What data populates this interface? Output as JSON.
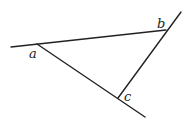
{
  "diagram": {
    "type": "geometry-triangle-lines",
    "background": "#ffffff",
    "line_color": "#222222",
    "lines": [
      {
        "name": "line-ab",
        "x1": 11,
        "y1": 47,
        "x2": 166,
        "y2": 30
      },
      {
        "name": "line-ac",
        "x1": 37,
        "y1": 44,
        "x2": 145,
        "y2": 117
      },
      {
        "name": "line-bc",
        "x1": 181,
        "y1": 12,
        "x2": 118,
        "y2": 98
      }
    ],
    "labels": [
      {
        "name": "label-a",
        "text": "a",
        "x": 29,
        "y": 58
      },
      {
        "name": "label-b",
        "text": "b",
        "x": 157,
        "y": 28
      },
      {
        "name": "label-c",
        "text": "c",
        "x": 124,
        "y": 101
      }
    ]
  }
}
